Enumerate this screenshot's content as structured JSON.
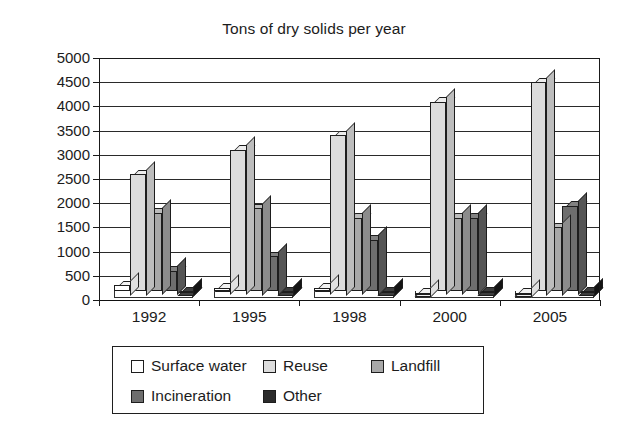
{
  "chart_data": {
    "type": "bar",
    "title": "Tons of dry solids per year",
    "xlabel": "",
    "ylabel": "",
    "categories": [
      "1992",
      "1995",
      "1998",
      "2000",
      "2005"
    ],
    "ylim": [
      0,
      5000
    ],
    "yticks": [
      0,
      500,
      1000,
      1500,
      2000,
      2500,
      3000,
      3500,
      4000,
      4500,
      5000
    ],
    "ytick_labels": [
      "0",
      "500",
      "1000",
      "1500",
      "2000",
      "2500",
      "3000",
      "3500",
      "4000",
      "4500",
      "5000"
    ],
    "grid": true,
    "legend_position": "bottom",
    "series": [
      {
        "name": "Surface water",
        "color": "#ffffff",
        "side_color": "#e0e0e0",
        "top_color": "#f2f2f2",
        "values": [
          300,
          250,
          250,
          150,
          150
        ]
      },
      {
        "name": "Reuse",
        "color": "#dcdcdc",
        "side_color": "#bdbdbd",
        "top_color": "#ededed",
        "values": [
          2600,
          3100,
          3400,
          4100,
          4500
        ]
      },
      {
        "name": "Landfill",
        "color": "#a8a8a8",
        "side_color": "#8c8c8c",
        "top_color": "#bcbcbc",
        "values": [
          1800,
          1900,
          1700,
          1700,
          1500
        ]
      },
      {
        "name": "Incineration",
        "color": "#6e6e6e",
        "side_color": "#555555",
        "top_color": "#828282",
        "values": [
          600,
          900,
          1250,
          1700,
          1950
        ]
      },
      {
        "name": "Other",
        "color": "#2b2b2b",
        "side_color": "#141414",
        "top_color": "#3d3d3d",
        "values": [
          180,
          180,
          180,
          180,
          180
        ]
      }
    ]
  },
  "legend": {
    "rows": [
      [
        "Surface water",
        "Reuse",
        "Landfill"
      ],
      [
        "Incineration",
        "Other"
      ]
    ]
  }
}
